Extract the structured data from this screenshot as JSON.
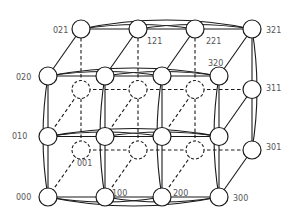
{
  "diagram": {
    "type": "3D torus / folded mesh network topology (4 x 3 x 2)",
    "dimensions": {
      "x": 4,
      "y": 3,
      "z": 2
    },
    "colors": {
      "stroke": "#1a1a1a",
      "node_fill": "#ffffff",
      "label": "#555555"
    },
    "node_radius": 9,
    "origin": {
      "x": 48,
      "y": 197
    },
    "step": {
      "x": 57,
      "y": -60.5
    },
    "depth_offset": {
      "x": 33,
      "y": -47
    },
    "labels": [
      {
        "id": "000",
        "text": "000",
        "x": 16,
        "y": 200
      },
      {
        "id": "010",
        "text": "010",
        "x": 12,
        "y": 139
      },
      {
        "id": "020",
        "text": "020",
        "x": 16,
        "y": 80
      },
      {
        "id": "001",
        "text": "001",
        "x": 77,
        "y": 166
      },
      {
        "id": "100",
        "text": "100",
        "x": 112,
        "y": 196
      },
      {
        "id": "200",
        "text": "200",
        "x": 173,
        "y": 196
      },
      {
        "id": "300",
        "text": "300",
        "x": 233,
        "y": 201
      },
      {
        "id": "021",
        "text": "021",
        "x": 53,
        "y": 33
      },
      {
        "id": "121",
        "text": "121",
        "x": 147,
        "y": 44
      },
      {
        "id": "221",
        "text": "221",
        "x": 206,
        "y": 44
      },
      {
        "id": "321",
        "text": "321",
        "x": 266,
        "y": 33
      },
      {
        "id": "320",
        "text": "320",
        "x": 208,
        "y": 66
      },
      {
        "id": "311",
        "text": "311",
        "x": 266,
        "y": 91
      },
      {
        "id": "301",
        "text": "301",
        "x": 266,
        "y": 150
      }
    ]
  }
}
